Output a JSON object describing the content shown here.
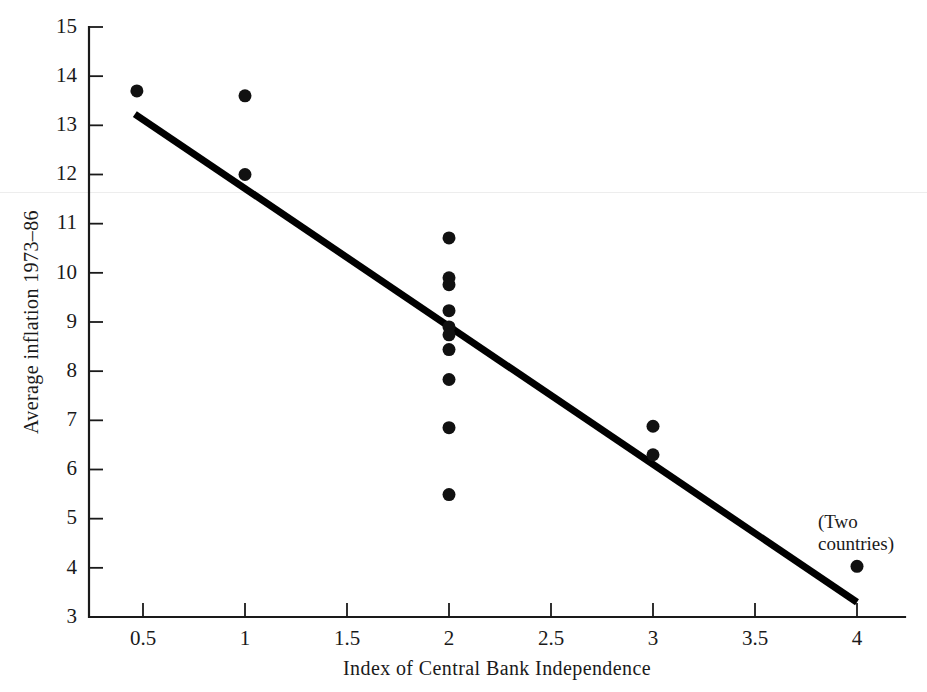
{
  "chart_data": {
    "type": "scatter",
    "title": "",
    "xlabel": "Index of Central Bank Independence",
    "ylabel": "Average inflation 1973–86",
    "xlim": [
      0.2,
      4.25
    ],
    "ylim": [
      3,
      15
    ],
    "grid": false,
    "legend": "none",
    "xticks": [
      0.5,
      1,
      1.5,
      2,
      2.5,
      3,
      3.5,
      4
    ],
    "xtick_labels": [
      "0.5",
      "1",
      "1.5",
      "2",
      "2.5",
      "3",
      "3.5",
      "4"
    ],
    "yticks": [
      3,
      4,
      5,
      6,
      7,
      8,
      9,
      10,
      11,
      12,
      13,
      14,
      15
    ],
    "ytick_labels": [
      "3",
      "4",
      "5",
      "6",
      "7",
      "8",
      "9",
      "10",
      "11",
      "12",
      "13",
      "14",
      "15"
    ],
    "points": [
      {
        "x": 0.47,
        "y": 13.7
      },
      {
        "x": 1.0,
        "y": 13.6
      },
      {
        "x": 1.0,
        "y": 12.0
      },
      {
        "x": 2.0,
        "y": 10.71
      },
      {
        "x": 2.0,
        "y": 9.9
      },
      {
        "x": 2.0,
        "y": 9.76
      },
      {
        "x": 2.0,
        "y": 9.23
      },
      {
        "x": 2.0,
        "y": 8.9
      },
      {
        "x": 2.0,
        "y": 8.74
      },
      {
        "x": 2.0,
        "y": 8.44
      },
      {
        "x": 2.0,
        "y": 7.83
      },
      {
        "x": 2.0,
        "y": 6.85
      },
      {
        "x": 2.0,
        "y": 5.49
      },
      {
        "x": 3.0,
        "y": 6.88
      },
      {
        "x": 3.0,
        "y": 6.3
      },
      {
        "x": 4.0,
        "y": 4.03
      }
    ],
    "fit_line": {
      "x0": 0.46,
      "y0": 13.23,
      "x1": 4.0,
      "y1": 3.3,
      "label": "linear regression fit"
    },
    "annotations": [
      {
        "text_line1": "(Two",
        "text_line2": "countries)",
        "x": 4.0,
        "y": 5.25,
        "target_point_index": 15
      }
    ],
    "colors": {
      "marker": "#111111",
      "line": "#000000",
      "axis": "#1a1a1a",
      "background": "#ffffff",
      "scan_artifact": "#ededed"
    }
  }
}
